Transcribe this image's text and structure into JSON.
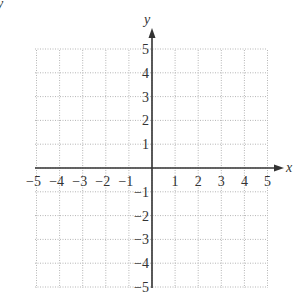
{
  "figure": {
    "corner_label": "y"
  },
  "chart_data": {
    "type": "grid",
    "title": "",
    "xlabel": "x",
    "ylabel": "y",
    "xlim": [
      -5,
      5
    ],
    "ylim": [
      -5,
      5
    ],
    "grid": true,
    "grid_style": "dotted",
    "x_ticks": [
      -5,
      -4,
      -3,
      -2,
      -1,
      1,
      2,
      3,
      4,
      5
    ],
    "y_ticks": [
      5,
      4,
      3,
      2,
      1,
      -1,
      -2,
      -3,
      -4,
      -5
    ],
    "x_tick_labels": [
      "−5",
      "−4",
      "−3",
      "−2",
      "−1",
      "1",
      "2",
      "3",
      "4",
      "5"
    ],
    "y_tick_labels": [
      "5",
      "4",
      "3",
      "2",
      "1",
      "−1",
      "−2",
      "−3",
      "−4",
      "−5"
    ],
    "arrows": {
      "x_positive": true,
      "y_positive": true
    }
  },
  "colors": {
    "axis": "#333333",
    "grid": "#b5b5b5",
    "text": "#333333",
    "background": "#ffffff"
  }
}
